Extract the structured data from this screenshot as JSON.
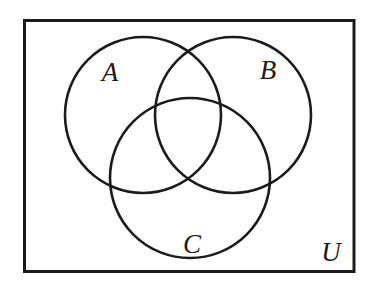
{
  "figure": {
    "type": "venn",
    "sets": [
      {
        "label": "A"
      },
      {
        "label": "B"
      },
      {
        "label": "C"
      }
    ],
    "universal_set": {
      "label": "U"
    }
  },
  "colors": {
    "line": "#1b1b1b",
    "background": "#ffffff"
  }
}
